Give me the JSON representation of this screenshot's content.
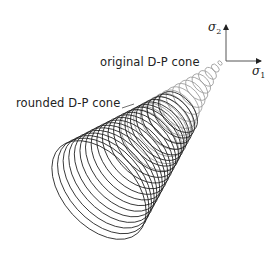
{
  "figure": {
    "labels": {
      "original_cone": "original D-P cone",
      "rounded_cone": "rounded D-P cone"
    },
    "axes": {
      "sigma2_symbol": "σ",
      "sigma2_sub": "2",
      "sigma1_symbol": "σ",
      "sigma1_sub": "1"
    },
    "colors": {
      "rounded_cone_stroke": "#1a1a1a",
      "original_cone_stroke": "#9a9a9a",
      "axis_stroke": "#555555",
      "background": "#ffffff"
    }
  }
}
